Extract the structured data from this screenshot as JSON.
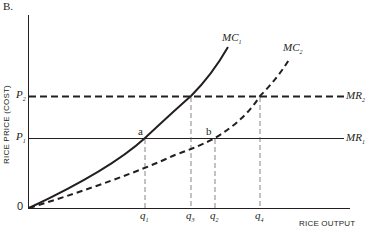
{
  "panel_label": "B.",
  "axes": {
    "y_label": "RICE PRICE (COST)",
    "x_label": "RICE OUTPUT",
    "origin": "0"
  },
  "price_levels": [
    {
      "name": "P",
      "sub": "2",
      "line": "dashed",
      "curve_label": "MR",
      "curve_sub": "2"
    },
    {
      "name": "P",
      "sub": "1",
      "line": "solid",
      "curve_label": "MR",
      "curve_sub": "1"
    }
  ],
  "curves": [
    {
      "name": "MC",
      "sub": "1",
      "style": "solid"
    },
    {
      "name": "MC",
      "sub": "2",
      "style": "dashed"
    }
  ],
  "points": [
    {
      "label": "a"
    },
    {
      "label": "b"
    }
  ],
  "quantities": [
    {
      "name": "q",
      "sub": "1"
    },
    {
      "name": "q",
      "sub": "3"
    },
    {
      "name": "q",
      "sub": "2"
    },
    {
      "name": "q",
      "sub": "4"
    }
  ]
}
